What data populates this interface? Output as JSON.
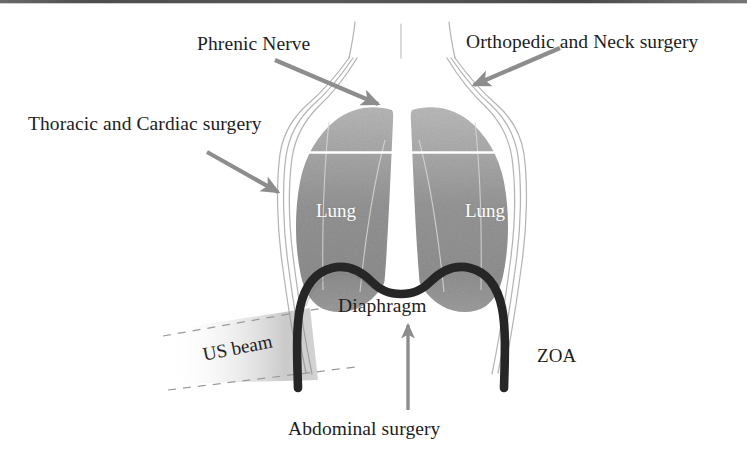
{
  "figure": {
    "kind": "anatomical-diagram",
    "background_color": "#ffffff",
    "width": 747,
    "height": 468
  },
  "labels": {
    "phrenic_nerve": "Phrenic Nerve",
    "orthopedic_neck_surgery": "Orthopedic and Neck surgery",
    "thoracic_cardiac_surgery": "Thoracic and Cardiac surgery",
    "diaphragm": "Diaphragm",
    "abdominal_surgery": "Abdominal surgery",
    "us_beam": "US beam",
    "zoa": "ZOA",
    "lung_left": "Lung",
    "lung_right": "Lung"
  },
  "colors": {
    "lung_fill": "#9a9a9a",
    "lung_fill_light": "#b5b5b5",
    "diaphragm_stroke": "#262626",
    "arrow": "#8d8d8d",
    "body_outline": "#b3b3b3",
    "text": "#1d1d1d",
    "lung_text": "#fdfdfd",
    "beam_dash": "#9b9b9b",
    "scan_artifact": "#3f3f3f"
  },
  "annotations": [
    {
      "name": "phrenic-nerve-arrow",
      "from": "Phrenic Nerve",
      "points_to": "upper mediastinum / lung apex"
    },
    {
      "name": "orthopedic-neck-arrow",
      "from": "Orthopedic and Neck surgery",
      "points_to": "right neck / thoracic inlet"
    },
    {
      "name": "thoracic-cardiac-arrow",
      "from": "Thoracic and Cardiac surgery",
      "points_to": "left chest wall"
    },
    {
      "name": "abdominal-surgery-arrow",
      "from": "Abdominal surgery",
      "points_to": "diaphragm from below"
    }
  ],
  "icons": {
    "arrow": "arrow-icon",
    "beam": "ultrasound-beam-icon"
  }
}
